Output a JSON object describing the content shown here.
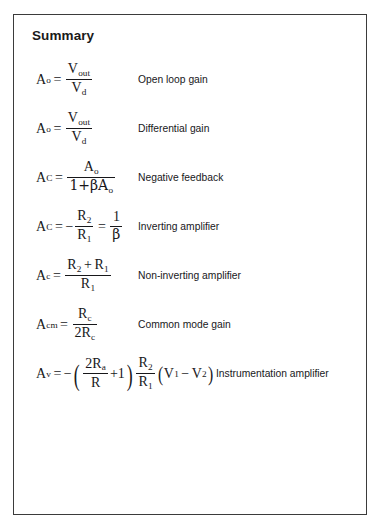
{
  "slide": {
    "title": "Summary",
    "rows": [
      {
        "id": "open-loop-gain",
        "lhs": "A",
        "lhs_sub": "o",
        "equals": "=",
        "numerator": "V",
        "numerator_sub": "out",
        "denominator": "V",
        "denominator_sub": "d",
        "formula_text": "A_o = V_out / V_d",
        "description": "Open loop gain"
      },
      {
        "id": "differential-gain",
        "lhs": "A",
        "lhs_sub": "o",
        "equals": "=",
        "numerator": "V",
        "numerator_sub": "out",
        "denominator": "V",
        "denominator_sub": "d",
        "formula_text": "A_o = V_out / V_d",
        "description": "Differential gain"
      },
      {
        "id": "negative-feedback",
        "lhs": "A",
        "lhs_sub": "C",
        "equals": "=",
        "numerator": "A",
        "numerator_sub": "o",
        "denominator": "1+βA",
        "denominator_sub": "o",
        "formula_text": "A_C = A_o / (1 + βA_o)",
        "description": "Negative feedback"
      },
      {
        "id": "inverting-amplifier",
        "lhs": "A",
        "lhs_sub": "C",
        "equals": "=",
        "sign": "−",
        "numerator": "R",
        "numerator_sub": "2",
        "denominator": "R",
        "denominator_sub": "1",
        "equals2": "=",
        "numerator2": "1",
        "denominator2": "β",
        "formula_text": "A_C = −R_2/R_1 = 1/β",
        "description": "Inverting amplifier"
      },
      {
        "id": "non-inverting-amplifier",
        "lhs": "A",
        "lhs_sub": "c",
        "equals": "=",
        "numerator": "R",
        "numerator_sub": "2",
        "numerator_op": "+",
        "numerator2": "R",
        "numerator2_sub": "1",
        "denominator": "R",
        "denominator_sub": "1",
        "formula_text": "A_c = (R_2 + R_1) / R_1",
        "description": "Non-inverting amplifier"
      },
      {
        "id": "common-mode-gain",
        "lhs": "A",
        "lhs_sub": "cm",
        "equals": "=",
        "numerator": "R",
        "numerator_sub": "c",
        "denominator_coeff": "2",
        "denominator": "R",
        "denominator_sub": "c",
        "formula_text": "A_cm = R_c / 2R_c",
        "description": "Common mode gain"
      },
      {
        "id": "instrumentation-amplifier",
        "lhs": "A",
        "lhs_sub": "v",
        "equals": "=",
        "sign": "−",
        "paren_open": "(",
        "numerator": "2R",
        "numerator_sub": "a",
        "denominator": "R",
        "plus_one": "+1",
        "paren_close": ")",
        "numerator2": "R",
        "numerator2_sub": "2",
        "denominator2": "R",
        "denominator2_sub": "1",
        "paren2_open": "(",
        "v1": "V",
        "v1_sub": "1",
        "minus": "−",
        "v2": "V",
        "v2_sub": "2",
        "paren2_close": ")",
        "formula_text": "A_v = −(2R_a/R + 1)(R_2/R_1)(V_1 − V_2)",
        "description": "Instrumentation amplifier"
      }
    ]
  }
}
